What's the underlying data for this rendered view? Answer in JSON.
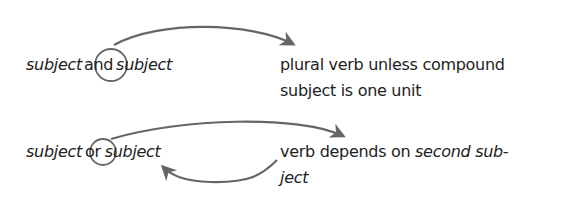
{
  "rule1": {
    "left": {
      "subject_a": "subject",
      "conjunction": "and",
      "subject_b": "subject"
    },
    "right": {
      "line1": "plural verb unless compound",
      "line2": "subject is one unit"
    }
  },
  "rule2": {
    "left": {
      "subject_a": "subject",
      "conjunction": "or",
      "subject_b": "subject"
    },
    "right": {
      "line1_plain": "verb depends on ",
      "line1_italic": "second sub-",
      "line2_italic": "ject"
    }
  },
  "colors": {
    "text": "#222222",
    "arrow": "#666666",
    "circle": "#666666"
  }
}
